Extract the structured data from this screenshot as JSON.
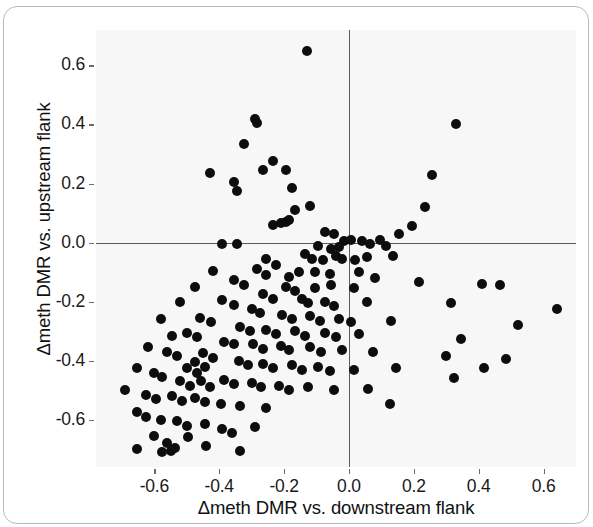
{
  "chart_data": {
    "type": "scatter",
    "title": "",
    "xlabel": "Δmeth DMR vs. downstream flank",
    "ylabel": "Δmeth DMR vs. upstream flank",
    "xlim": [
      -0.78,
      0.7
    ],
    "ylim": [
      -0.76,
      0.72
    ],
    "xticks": [
      -0.6,
      -0.4,
      -0.2,
      0.0,
      0.2,
      0.4,
      0.6
    ],
    "xticklabels": [
      "-0.6",
      "-0.4",
      "-0.2",
      "0.0",
      "0.2",
      "0.4",
      "0.6"
    ],
    "yticks": [
      -0.6,
      -0.4,
      -0.2,
      0.0,
      0.2,
      0.4,
      0.6
    ],
    "yticklabels": [
      "-0.6",
      "-0.4",
      "-0.2",
      "0.0",
      "0.2",
      "0.4",
      "0.6"
    ],
    "grid": false,
    "legend": null,
    "reference_lines": [
      {
        "axis": "horizontal",
        "value": 0.0
      },
      {
        "axis": "vertical",
        "value": 0.0
      }
    ],
    "marker": {
      "shape": "circle",
      "color": "#0d0d0d",
      "size": 10
    },
    "panel_background": "#f7f7f7",
    "n_points": 168,
    "points": [
      [
        -0.13,
        0.65
      ],
      [
        -0.29,
        0.42
      ],
      [
        -0.285,
        0.405
      ],
      [
        -0.325,
        0.335
      ],
      [
        -0.235,
        0.275
      ],
      [
        -0.265,
        0.245
      ],
      [
        -0.195,
        0.245
      ],
      [
        -0.43,
        0.235
      ],
      [
        -0.355,
        0.205
      ],
      [
        -0.345,
        0.175
      ],
      [
        -0.175,
        0.185
      ],
      [
        0.33,
        0.4
      ],
      [
        0.255,
        0.23
      ],
      [
        -0.12,
        0.125
      ],
      [
        -0.165,
        0.11
      ],
      [
        -0.21,
        0.065
      ],
      [
        -0.235,
        0.06
      ],
      [
        -0.195,
        0.07
      ],
      [
        -0.185,
        0.075
      ],
      [
        0.235,
        0.12
      ],
      [
        -0.075,
        0.035
      ],
      [
        -0.045,
        0.03
      ],
      [
        0.195,
        0.055
      ],
      [
        0.155,
        0.03
      ],
      [
        -0.39,
        -0.005
      ],
      [
        -0.345,
        -0.005
      ],
      [
        -0.015,
        0.005
      ],
      [
        0.005,
        0.01
      ],
      [
        0.04,
        0.005
      ],
      [
        0.065,
        -0.005
      ],
      [
        -0.095,
        -0.01
      ],
      [
        -0.055,
        -0.02
      ],
      [
        -0.03,
        -0.015
      ],
      [
        0.095,
        0.01
      ],
      [
        0.115,
        -0.01
      ],
      [
        -0.135,
        -0.04
      ],
      [
        -0.115,
        -0.055
      ],
      [
        -0.08,
        -0.06
      ],
      [
        -0.04,
        -0.045
      ],
      [
        -0.02,
        -0.055
      ],
      [
        0.02,
        -0.06
      ],
      [
        0.055,
        -0.05
      ],
      [
        0.135,
        -0.045
      ],
      [
        -0.255,
        -0.055
      ],
      [
        -0.225,
        -0.075
      ],
      [
        -0.285,
        -0.09
      ],
      [
        -0.255,
        -0.11
      ],
      [
        -0.185,
        -0.115
      ],
      [
        -0.155,
        -0.1
      ],
      [
        -0.105,
        -0.1
      ],
      [
        -0.06,
        -0.105
      ],
      [
        0.03,
        -0.1
      ],
      [
        0.08,
        -0.12
      ],
      [
        -0.355,
        -0.125
      ],
      [
        -0.325,
        -0.145
      ],
      [
        -0.42,
        -0.095
      ],
      [
        -0.195,
        -0.15
      ],
      [
        -0.165,
        -0.165
      ],
      [
        -0.105,
        -0.155
      ],
      [
        -0.055,
        -0.145
      ],
      [
        0.015,
        -0.155
      ],
      [
        0.215,
        -0.135
      ],
      [
        0.41,
        -0.14
      ],
      [
        0.465,
        -0.145
      ],
      [
        -0.475,
        -0.15
      ],
      [
        -0.265,
        -0.175
      ],
      [
        -0.235,
        -0.19
      ],
      [
        -0.145,
        -0.19
      ],
      [
        -0.125,
        -0.205
      ],
      [
        -0.075,
        -0.2
      ],
      [
        -0.045,
        -0.215
      ],
      [
        0.055,
        -0.2
      ],
      [
        0.315,
        -0.205
      ],
      [
        0.64,
        -0.225
      ],
      [
        -0.39,
        -0.195
      ],
      [
        -0.355,
        -0.21
      ],
      [
        -0.52,
        -0.2
      ],
      [
        -0.3,
        -0.225
      ],
      [
        -0.275,
        -0.24
      ],
      [
        -0.205,
        -0.245
      ],
      [
        -0.175,
        -0.26
      ],
      [
        -0.12,
        -0.25
      ],
      [
        -0.09,
        -0.265
      ],
      [
        -0.03,
        -0.26
      ],
      [
        0.005,
        -0.27
      ],
      [
        0.13,
        -0.265
      ],
      [
        0.52,
        -0.28
      ],
      [
        -0.46,
        -0.255
      ],
      [
        -0.425,
        -0.27
      ],
      [
        -0.58,
        -0.26
      ],
      [
        -0.335,
        -0.285
      ],
      [
        -0.305,
        -0.3
      ],
      [
        -0.255,
        -0.295
      ],
      [
        -0.225,
        -0.31
      ],
      [
        -0.165,
        -0.3
      ],
      [
        -0.135,
        -0.315
      ],
      [
        -0.075,
        -0.305
      ],
      [
        -0.04,
        -0.32
      ],
      [
        0.03,
        -0.31
      ],
      [
        0.345,
        -0.325
      ],
      [
        -0.5,
        -0.305
      ],
      [
        -0.47,
        -0.32
      ],
      [
        -0.545,
        -0.315
      ],
      [
        -0.385,
        -0.335
      ],
      [
        -0.355,
        -0.345
      ],
      [
        -0.295,
        -0.345
      ],
      [
        -0.265,
        -0.36
      ],
      [
        -0.21,
        -0.35
      ],
      [
        -0.185,
        -0.365
      ],
      [
        -0.12,
        -0.355
      ],
      [
        -0.085,
        -0.37
      ],
      [
        -0.02,
        -0.365
      ],
      [
        0.075,
        -0.37
      ],
      [
        0.3,
        -0.385
      ],
      [
        0.485,
        -0.395
      ],
      [
        -0.62,
        -0.355
      ],
      [
        -0.56,
        -0.37
      ],
      [
        -0.53,
        -0.385
      ],
      [
        -0.45,
        -0.375
      ],
      [
        -0.42,
        -0.39
      ],
      [
        -0.475,
        -0.405
      ],
      [
        -0.445,
        -0.42
      ],
      [
        -0.5,
        -0.425
      ],
      [
        -0.47,
        -0.44
      ],
      [
        -0.34,
        -0.4
      ],
      [
        -0.31,
        -0.415
      ],
      [
        -0.265,
        -0.41
      ],
      [
        -0.235,
        -0.425
      ],
      [
        -0.175,
        -0.415
      ],
      [
        -0.145,
        -0.43
      ],
      [
        -0.095,
        -0.42
      ],
      [
        -0.06,
        -0.435
      ],
      [
        0.015,
        -0.43
      ],
      [
        0.145,
        -0.425
      ],
      [
        0.325,
        -0.46
      ],
      [
        0.415,
        -0.425
      ],
      [
        -0.655,
        -0.425
      ],
      [
        -0.6,
        -0.44
      ],
      [
        -0.575,
        -0.455
      ],
      [
        -0.52,
        -0.47
      ],
      [
        -0.49,
        -0.485
      ],
      [
        -0.455,
        -0.47
      ],
      [
        -0.43,
        -0.49
      ],
      [
        -0.385,
        -0.465
      ],
      [
        -0.355,
        -0.48
      ],
      [
        -0.3,
        -0.475
      ],
      [
        -0.27,
        -0.49
      ],
      [
        -0.215,
        -0.485
      ],
      [
        -0.185,
        -0.5
      ],
      [
        -0.125,
        -0.49
      ],
      [
        -0.045,
        -0.5
      ],
      [
        0.06,
        -0.495
      ],
      [
        0.125,
        -0.545
      ],
      [
        -0.69,
        -0.5
      ],
      [
        -0.625,
        -0.515
      ],
      [
        -0.595,
        -0.53
      ],
      [
        -0.545,
        -0.52
      ],
      [
        -0.515,
        -0.535
      ],
      [
        -0.475,
        -0.525
      ],
      [
        -0.445,
        -0.54
      ],
      [
        -0.395,
        -0.545
      ],
      [
        -0.335,
        -0.555
      ],
      [
        -0.255,
        -0.56
      ],
      [
        -0.655,
        -0.575
      ],
      [
        -0.625,
        -0.59
      ],
      [
        -0.58,
        -0.6
      ],
      [
        -0.53,
        -0.605
      ],
      [
        -0.5,
        -0.62
      ],
      [
        -0.445,
        -0.615
      ],
      [
        -0.39,
        -0.63
      ],
      [
        -0.36,
        -0.645
      ],
      [
        -0.29,
        -0.625
      ],
      [
        -0.6,
        -0.655
      ],
      [
        -0.56,
        -0.68
      ],
      [
        -0.535,
        -0.695
      ],
      [
        -0.495,
        -0.66
      ],
      [
        -0.44,
        -0.69
      ],
      [
        -0.655,
        -0.7
      ],
      [
        -0.575,
        -0.71
      ],
      [
        -0.55,
        -0.705
      ],
      [
        -0.335,
        -0.705
      ]
    ]
  },
  "axes": {
    "x_tick_labels": [
      "-0.6",
      "-0.4",
      "-0.2",
      "0.0",
      "0.2",
      "0.4",
      "0.6"
    ],
    "y_tick_labels": [
      "0.6",
      "0.4",
      "0.2",
      "0.0",
      "-0.2",
      "-0.4",
      "-0.6"
    ],
    "x_axis_title": "Δmeth DMR vs. downstream flank",
    "y_axis_title": "Δmeth DMR vs. upstream flank"
  }
}
